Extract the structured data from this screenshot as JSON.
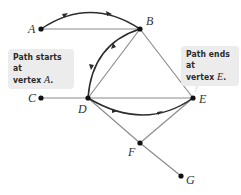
{
  "diagram": {
    "type": "graph",
    "colors": {
      "edge": "#8c8c8c",
      "path": "#2b2b2b",
      "vertex": "#111111",
      "callout_bg": "#ececec"
    },
    "vertices": [
      {
        "id": "A",
        "label": "A",
        "x": 41,
        "y": 29
      },
      {
        "id": "B",
        "label": "B",
        "x": 140,
        "y": 29
      },
      {
        "id": "C",
        "label": "C",
        "x": 41,
        "y": 98
      },
      {
        "id": "D",
        "label": "D",
        "x": 88,
        "y": 98
      },
      {
        "id": "E",
        "label": "E",
        "x": 193,
        "y": 98
      },
      {
        "id": "F",
        "label": "F",
        "x": 140,
        "y": 143
      },
      {
        "id": "G",
        "label": "G",
        "x": 181,
        "y": 176
      }
    ],
    "edges": [
      [
        "A",
        "B"
      ],
      [
        "B",
        "D"
      ],
      [
        "B",
        "E"
      ],
      [
        "C",
        "D"
      ],
      [
        "D",
        "E"
      ],
      [
        "D",
        "F"
      ],
      [
        "F",
        "E"
      ],
      [
        "F",
        "G"
      ]
    ],
    "path": [
      "A",
      "B",
      "D",
      "E"
    ],
    "callouts": {
      "start": {
        "line1": "Path starts at",
        "line2_prefix": "vertex ",
        "vertex": "A",
        "suffix": "."
      },
      "end": {
        "line1": "Path ends at",
        "line2_prefix": "vertex ",
        "vertex": "E",
        "suffix": "."
      }
    }
  }
}
